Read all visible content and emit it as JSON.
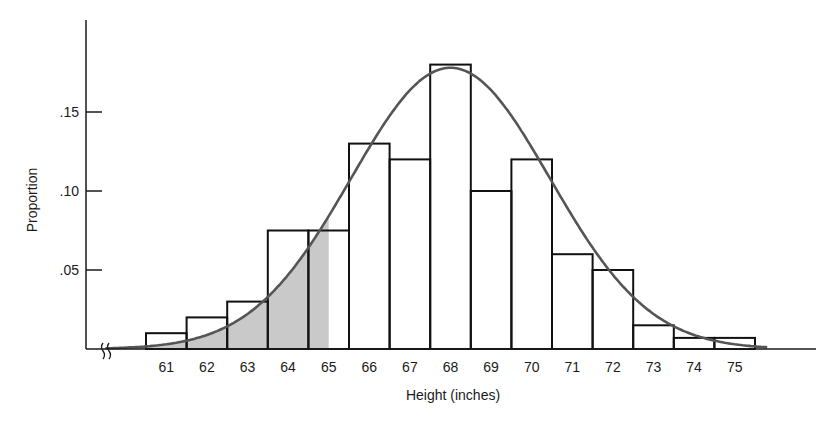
{
  "chart_data": {
    "type": "bar",
    "subtype": "histogram-with-normal-curve",
    "title": "",
    "xlabel": "Height (inches)",
    "ylabel": "Proportion",
    "categories": [
      "61",
      "62",
      "63",
      "64",
      "65",
      "66",
      "67",
      "68",
      "69",
      "70",
      "71",
      "72",
      "73",
      "74",
      "75"
    ],
    "values": [
      0.01,
      0.02,
      0.03,
      0.075,
      0.075,
      0.13,
      0.12,
      0.18,
      0.1,
      0.12,
      0.06,
      0.05,
      0.015,
      0.007,
      0.007
    ],
    "yticks": [
      ".05",
      ".10",
      ".15"
    ],
    "ytick_values": [
      0.05,
      0.1,
      0.15
    ],
    "ylim": [
      0,
      0.2
    ],
    "xlim": [
      60,
      76
    ],
    "grid": false,
    "legend": null,
    "axis_break": "x-axis break symbol near origin",
    "overlay": {
      "type": "normal-curve",
      "mean": 68,
      "peak_proportion": 0.178,
      "color": "#555555"
    },
    "shaded_region": {
      "description": "area under normal curve left of ~65.0 inches",
      "from": 59.5,
      "to": 65.0,
      "color": "#c8c8c8"
    }
  },
  "colors": {
    "axis": "#1a1a1a",
    "bar_stroke": "#111111",
    "bar_fill": "#ffffff",
    "curve": "#555555",
    "shade": "#c9c9c9"
  }
}
